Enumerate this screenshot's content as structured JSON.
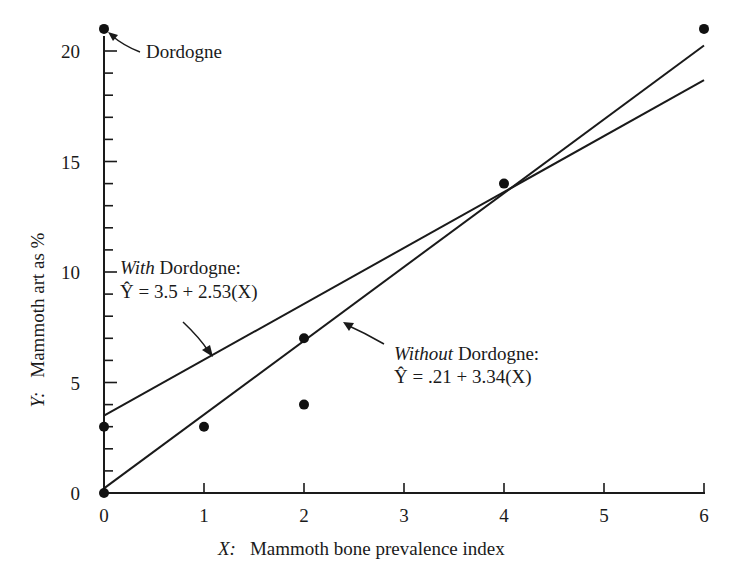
{
  "chart_data": {
    "type": "scatter",
    "title": "",
    "xlabel_var": "X:",
    "xlabel": "Mammoth bone prevalence index",
    "ylabel_var": "Y:",
    "ylabel": "Mammoth art as %",
    "xlim": [
      0,
      6
    ],
    "ylim": [
      0,
      21
    ],
    "x_ticks": [
      0,
      1,
      2,
      3,
      4,
      5,
      6
    ],
    "y_ticks_labeled": [
      0,
      5,
      10,
      15,
      20
    ],
    "y_minor_tick_step": 1,
    "grid": false,
    "points": [
      {
        "x": 0,
        "y": 21,
        "label": "Dordogne"
      },
      {
        "x": 0,
        "y": 3
      },
      {
        "x": 0,
        "y": 0
      },
      {
        "x": 1,
        "y": 3
      },
      {
        "x": 2,
        "y": 7
      },
      {
        "x": 2,
        "y": 4
      },
      {
        "x": 4,
        "y": 14
      },
      {
        "x": 6,
        "y": 21
      }
    ],
    "series": [
      {
        "name": "With Dordogne",
        "type": "line",
        "intercept": 3.5,
        "slope": 2.53,
        "x": [
          0,
          6
        ],
        "y": [
          3.5,
          18.68
        ],
        "label_italic": "With",
        "label_rest": " Dordogne:",
        "equation": "Ŷ = 3.5 + 2.53(X)"
      },
      {
        "name": "Without Dordogne",
        "type": "line",
        "intercept": 0.21,
        "slope": 3.34,
        "x": [
          0,
          6
        ],
        "y": [
          0.21,
          20.25
        ],
        "label_italic": "Without",
        "label_rest": " Dordogne:",
        "equation": "Ŷ = .21 + 3.34(X)"
      }
    ],
    "annotations": [
      {
        "text": "Dordogne",
        "points_to": {
          "x": 0,
          "y": 21
        }
      }
    ]
  }
}
